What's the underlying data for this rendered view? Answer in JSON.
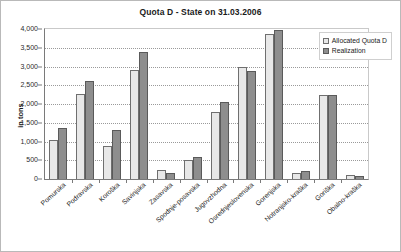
{
  "chart_data": {
    "type": "bar",
    "title": "Quota D - State on 31.03.2006",
    "xlabel": "",
    "ylabel": "in tons",
    "ylim": [
      0,
      4000
    ],
    "ytick_step": 500,
    "ytick_labels": [
      "4,000",
      "3,500",
      "3,000",
      "2,500",
      "2,000",
      "1,500",
      "1,000",
      "500",
      "0"
    ],
    "grid": true,
    "legend_position": "top-right",
    "categories": [
      "Pomurska",
      "Podravska",
      "Koroška",
      "Savinjska",
      "Zasavska",
      "Spodnje-posavska",
      "Jugovzhodna",
      "Osrednjeslovenska",
      "Gorenjska",
      "Notranjsko-kraška",
      "Goriška",
      "Obalno-kraška"
    ],
    "series": [
      {
        "name": "Allocated Quota D",
        "color": "#e8e8e8",
        "values": [
          1050,
          2280,
          870,
          2910,
          230,
          520,
          1780,
          3000,
          3860,
          150,
          2230,
          110
        ]
      },
      {
        "name": "Realization",
        "color": "#8e8e8e",
        "values": [
          1350,
          2620,
          1300,
          3400,
          150,
          600,
          2050,
          2870,
          3970,
          210,
          2240,
          90
        ]
      }
    ]
  }
}
